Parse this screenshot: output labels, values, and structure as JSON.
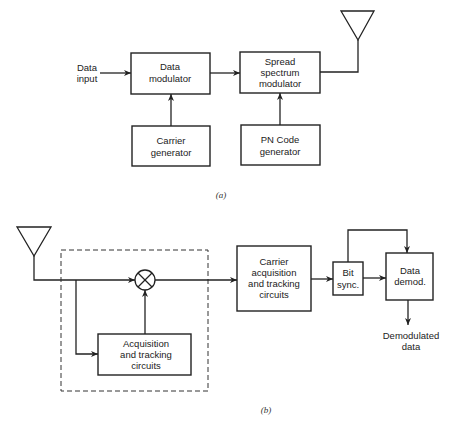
{
  "diagram_a": {
    "caption": "(a)",
    "input_label": [
      "Data",
      "input"
    ],
    "blocks": {
      "data_modulator": [
        "Data",
        "modulator"
      ],
      "spread_spectrum_modulator": [
        "Spread",
        "spectrum",
        "modulator"
      ],
      "carrier_generator": [
        "Carrier",
        "generator"
      ],
      "pn_code_generator": [
        "PN Code",
        "generator"
      ]
    }
  },
  "diagram_b": {
    "caption": "(b)",
    "blocks": {
      "acquisition_tracking": [
        "Acquisition",
        "and tracking",
        "circuits"
      ],
      "carrier_acquisition": [
        "Carrier",
        "acquisition",
        "and tracking",
        "circuits"
      ],
      "bit_sync": [
        "Bit",
        "sync."
      ],
      "data_demod": [
        "Data",
        "demod."
      ]
    },
    "output_label": [
      "Demodulated",
      "data"
    ]
  }
}
